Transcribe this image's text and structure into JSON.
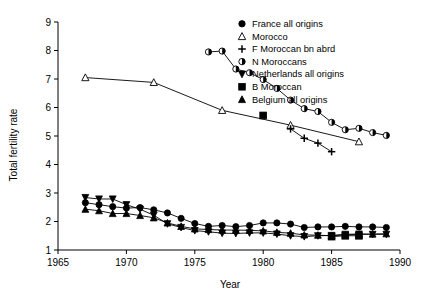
{
  "chart_data": {
    "type": "line",
    "title": "",
    "xlabel": "Year",
    "ylabel": "Total fertility rate",
    "xlim": [
      1965,
      1990
    ],
    "ylim": [
      1,
      9
    ],
    "xticks": [
      1965,
      1970,
      1975,
      1980,
      1985,
      1990
    ],
    "yticks": [
      1,
      2,
      3,
      4,
      5,
      6,
      7,
      8,
      9
    ],
    "grid": false,
    "legend_position": "top-right",
    "series": [
      {
        "name": "France all origins",
        "marker": "filled-circle",
        "x": [
          1967,
          1968,
          1969,
          1970,
          1971,
          1972,
          1973,
          1974,
          1975,
          1976,
          1977,
          1978,
          1979,
          1980,
          1981,
          1982,
          1983,
          1984,
          1985,
          1986,
          1987,
          1988,
          1989
        ],
        "values": [
          2.66,
          2.59,
          2.52,
          2.47,
          2.49,
          2.41,
          2.3,
          2.11,
          1.93,
          1.83,
          1.86,
          1.82,
          1.86,
          1.95,
          1.95,
          1.91,
          1.79,
          1.81,
          1.81,
          1.83,
          1.81,
          1.81,
          1.79
        ]
      },
      {
        "name": "Morocco",
        "marker": "open-triangle-up",
        "x": [
          1967,
          1972,
          1977,
          1982,
          1987
        ],
        "values": [
          7.05,
          6.88,
          5.9,
          5.38,
          4.8
        ]
      },
      {
        "name": "F Moroccan bn abrd",
        "marker": "plus",
        "x": [
          1982,
          1983,
          1984,
          1985
        ],
        "values": [
          5.25,
          4.92,
          4.75,
          4.45
        ]
      },
      {
        "name": "N Moroccans",
        "marker": "half-filled-circle",
        "x": [
          1976,
          1977,
          1978,
          1979,
          1980,
          1981,
          1982,
          1983,
          1984,
          1985,
          1986,
          1987,
          1988,
          1989
        ],
        "values": [
          7.95,
          7.98,
          7.35,
          7.22,
          6.98,
          6.67,
          6.26,
          5.96,
          5.86,
          5.48,
          5.22,
          5.27,
          5.12,
          5.02
        ]
      },
      {
        "name": "Netherlands all origins",
        "marker": "filled-triangle-down",
        "x": [
          1967,
          1968,
          1969,
          1970,
          1971,
          1972,
          1973,
          1974,
          1975,
          1976,
          1977,
          1978,
          1979,
          1980,
          1981,
          1982,
          1983,
          1984,
          1985,
          1986,
          1987,
          1988,
          1989
        ],
        "values": [
          2.84,
          2.79,
          2.79,
          2.59,
          2.43,
          2.22,
          1.92,
          1.79,
          1.68,
          1.64,
          1.59,
          1.58,
          1.6,
          1.6,
          1.56,
          1.5,
          1.47,
          1.5,
          1.51,
          1.55,
          1.56,
          1.55,
          1.55
        ]
      },
      {
        "name": "B Moroccan",
        "marker": "filled-square",
        "x": [
          1980,
          1985,
          1986,
          1987
        ],
        "values": [
          5.72,
          1.47,
          1.5,
          1.5
        ]
      },
      {
        "name": "Belgium all origins",
        "marker": "filled-triangle-up",
        "x": [
          1967,
          1968,
          1969,
          1970,
          1971,
          1972,
          1973,
          1974,
          1975,
          1976,
          1977,
          1978,
          1979,
          1980,
          1981,
          1982,
          1983,
          1984,
          1985,
          1986,
          1987,
          1988,
          1989
        ],
        "values": [
          2.43,
          2.38,
          2.28,
          2.28,
          2.21,
          2.13,
          1.95,
          1.83,
          1.74,
          1.72,
          1.7,
          1.7,
          1.69,
          1.67,
          1.62,
          1.59,
          1.53,
          1.52,
          1.5,
          1.53,
          1.55,
          1.56,
          1.57
        ]
      }
    ],
    "legend": [
      {
        "label": "France all origins",
        "marker": "filled-circle"
      },
      {
        "label": "Morocco",
        "marker": "open-triangle-up"
      },
      {
        "label": "F Moroccan bn abrd",
        "marker": "plus"
      },
      {
        "label": "N Moroccans",
        "marker": "half-filled-circle"
      },
      {
        "label": "Netherlands all origins",
        "marker": "filled-triangle-down"
      },
      {
        "label": "B Moroccan",
        "marker": "filled-square"
      },
      {
        "label": "Belgium all origins",
        "marker": "filled-triangle-up"
      }
    ]
  },
  "colors": {
    "ink": "#000000",
    "background": "#ffffff"
  }
}
